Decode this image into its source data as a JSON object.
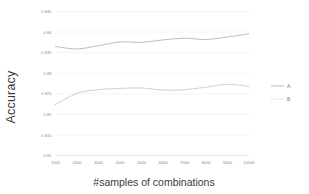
{
  "chart_data": {
    "type": "line",
    "title": "",
    "xlabel": "#samples of combinations",
    "ylabel": "Accuracy",
    "x": [
      1000,
      2000,
      3000,
      4000,
      5000,
      6000,
      7000,
      8000,
      9000,
      10000
    ],
    "xtick_labels": [
      "1000",
      "2000",
      "3000",
      "4000",
      "5000",
      "6000",
      "7000",
      "8000",
      "9000",
      "10000"
    ],
    "ytick_labels": [
      "0.81",
      "0.815",
      "0.82",
      "0.825",
      "0.83",
      "0.835",
      "0.84",
      "0.845"
    ],
    "ytick_values": [
      0.81,
      0.815,
      0.82,
      0.825,
      0.83,
      0.835,
      0.84,
      0.845
    ],
    "ylim": [
      0.81,
      0.845
    ],
    "xlim": [
      1000,
      10000
    ],
    "grid": "horizontal",
    "legend_position": "right",
    "series": [
      {
        "name": "A",
        "style": "solid",
        "color": "#b0b0b0",
        "values": [
          0.8365,
          0.8359,
          0.8367,
          0.8376,
          0.8375,
          0.8381,
          0.8385,
          0.8382,
          0.8388,
          0.8396
        ]
      },
      {
        "name": "B",
        "style": "dotted",
        "color": "#b5b5b5",
        "values": [
          0.8224,
          0.8251,
          0.826,
          0.8263,
          0.8264,
          0.8259,
          0.826,
          0.8266,
          0.8273,
          0.8268
        ]
      }
    ]
  },
  "legend": {
    "entries": [
      {
        "label": "A"
      },
      {
        "label": "B"
      }
    ]
  },
  "axes": {
    "x_title": "#samples of combinations",
    "y_title": "Accuracy"
  }
}
